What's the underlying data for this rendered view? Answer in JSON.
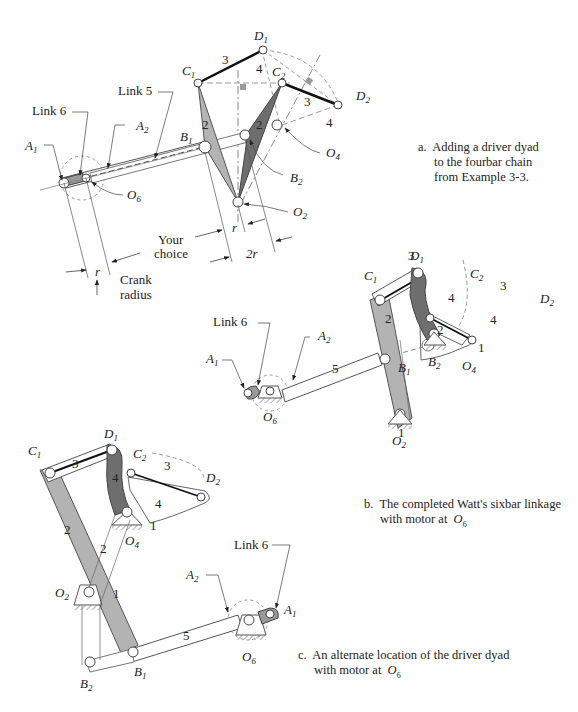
{
  "captions": {
    "a": {
      "marker": "a.",
      "line1": "Adding a driver dyad",
      "line2": "to the fourbar chain",
      "line3": "from Example 3-3."
    },
    "b": {
      "marker": "b.",
      "line1": "The completed Watt's sixbar linkage",
      "line2": "with motor at",
      "sym": "O",
      "sym_sub": "6"
    },
    "c": {
      "marker": "c.",
      "line1": "An alternate location of the driver dyad",
      "line2": "with motor at",
      "sym": "O",
      "sym_sub": "6"
    }
  },
  "panel_a": {
    "labels": {
      "link6": "Link 6",
      "link5": "Link 5",
      "A": "A",
      "A1_sub": "1",
      "A2_sub": "2",
      "B": "B",
      "B1_sub": "1",
      "B2_sub": "2",
      "C": "C",
      "C1_sub": "1",
      "C2_sub": "2",
      "D": "D",
      "D1_sub": "1",
      "D2_sub": "2",
      "O": "O",
      "O2_sub": "2",
      "O4_sub": "4",
      "O6_sub": "6",
      "link_2": "2",
      "link_3": "3",
      "link_4": "4",
      "your_choice_1": "Your",
      "your_choice_2": "choice",
      "r": "r",
      "two_r": "2r",
      "crank_radius_1": "Crank",
      "crank_radius_2": "radius"
    }
  },
  "panel_b": {
    "labels": {
      "link6": "Link 6",
      "link_1": "1",
      "link_2": "2",
      "link_3": "3",
      "link_4": "4",
      "link_5": "5"
    }
  },
  "panel_c": {
    "labels": {
      "link6": "Link 6",
      "link_1": "1",
      "link_2": "2",
      "link_3": "3",
      "link_4": "4",
      "link_5": "5"
    }
  },
  "colors": {
    "link2": "#b3b3b3",
    "link4": "#6e6e6e",
    "outline": "#555555",
    "dash": "#999999",
    "ink": "#222222"
  }
}
